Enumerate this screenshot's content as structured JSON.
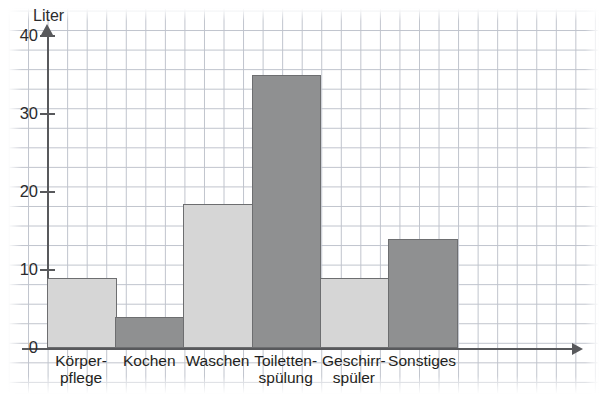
{
  "chart_data": {
    "type": "bar",
    "title": "",
    "subtitle": "",
    "xlabel": "",
    "ylabel": "Liter",
    "ylim": [
      0,
      42
    ],
    "yticks": [
      0,
      10,
      20,
      30,
      40
    ],
    "ytick_labels": [
      "0",
      "10",
      "20",
      "30",
      "40"
    ],
    "grid": true,
    "grid_style": "graph-paper",
    "legend": "none",
    "categories": [
      "Körper-\npflege",
      "Kochen",
      "Waschen",
      "Toiletten-\nspülung",
      "Geschirr-\nspüler",
      "Sonstiges"
    ],
    "category_lines": [
      [
        "Körper-",
        "pflege"
      ],
      [
        "Kochen",
        ""
      ],
      [
        "Waschen",
        ""
      ],
      [
        "Toiletten-",
        "spülung"
      ],
      [
        "Geschirr-",
        "spüler"
      ],
      [
        "Sonstiges",
        ""
      ]
    ],
    "values": [
      9,
      4,
      18.5,
      35,
      9,
      14
    ],
    "bar_shades": [
      "light",
      "dark",
      "light",
      "dark",
      "light",
      "dark"
    ],
    "colors": {
      "bar_light": "#d6d6d6",
      "bar_dark": "#8f9091",
      "bar_border": "#6d6e70",
      "axis": "#58595c",
      "grid_line": "#bfc3cc",
      "text": "#1f1f21",
      "background": "#ffffff"
    }
  },
  "axis": {
    "y_title": "Liter"
  }
}
